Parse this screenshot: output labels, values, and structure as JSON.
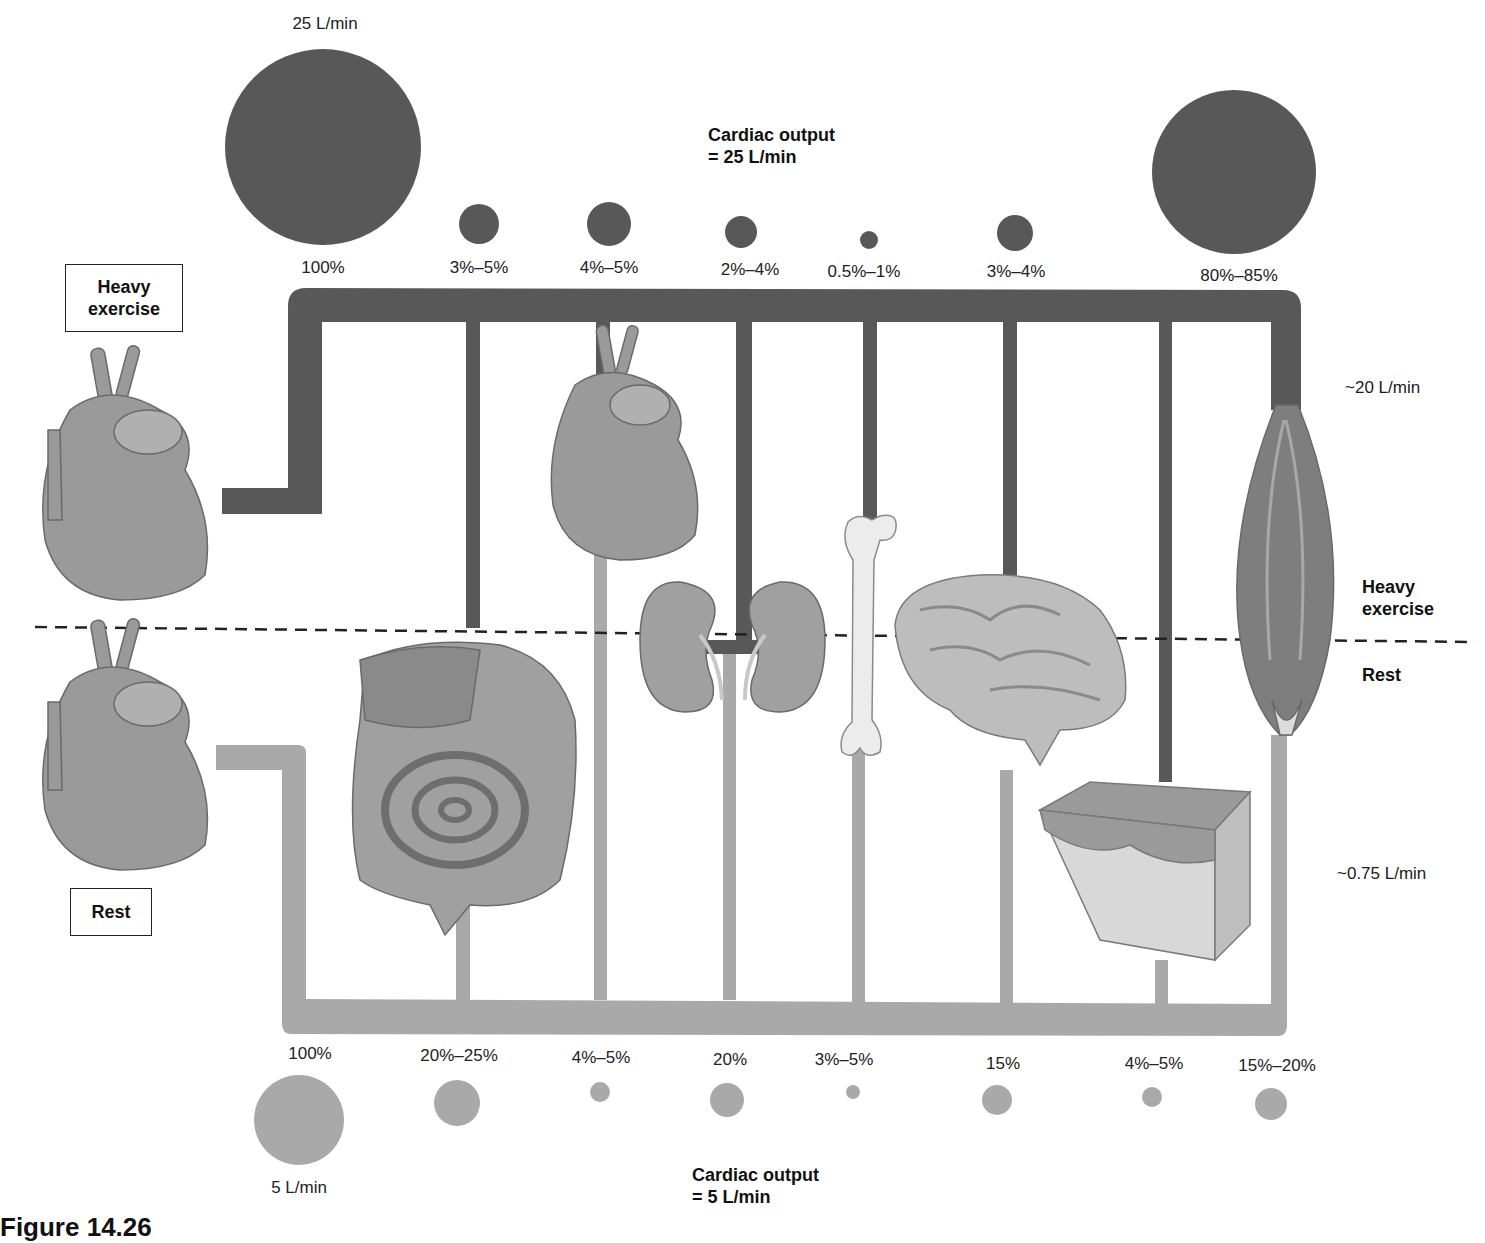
{
  "colors": {
    "exercise_flow": "#585858",
    "rest_flow": "#a9a9a9",
    "organ_fill": "#9a9a9a",
    "text": "#1a1a1a"
  },
  "labels": {
    "heavy_exercise_box": "Heavy exercise",
    "rest_box": "Rest",
    "divider_heavy": "Heavy exercise",
    "divider_rest": "Rest",
    "top_total_flow": "25 L/min",
    "bottom_total_flow": "5 L/min",
    "cardiac_output_exercise_line1": "Cardiac output",
    "cardiac_output_exercise_line2": "= 25 L/min",
    "cardiac_output_rest_line1": "Cardiac output",
    "cardiac_output_rest_line2": "= 5 L/min",
    "muscle_exercise_flow": "~20 L/min",
    "muscle_rest_flow": "~0.75 L/min",
    "caption": "Figure 14.26"
  },
  "chart_data": {
    "type": "bubble-flow-diagram",
    "categories": [
      "Total",
      "Digestive tract & liver",
      "Heart",
      "Kidneys",
      "Bone",
      "Brain",
      "Skin",
      "Skeletal muscle"
    ],
    "series": [
      {
        "name": "Heavy exercise",
        "cardiac_output": "25 L/min",
        "values": [
          "100%",
          "3%–5%",
          "4%–5%",
          "2%–4%",
          "0.5%–1%",
          "3%–4%",
          null,
          "80%–85%"
        ]
      },
      {
        "name": "Rest",
        "cardiac_output": "5 L/min",
        "values": [
          "100%",
          "20%–25%",
          "4%–5%",
          "20%",
          "3%–5%",
          "15%",
          "4%–5%",
          "15%–20%"
        ]
      }
    ],
    "annotations": [
      "25 L/min",
      "5 L/min",
      "~20 L/min",
      "~0.75 L/min"
    ]
  },
  "top_row": [
    {
      "label": "100%",
      "x": 323,
      "y": 268,
      "cx": 323,
      "cy": 147,
      "d": 196
    },
    {
      "label": "3%–5%",
      "x": 479,
      "y": 268,
      "cx": 479,
      "cy": 224,
      "d": 40
    },
    {
      "label": "4%–5%",
      "x": 609,
      "y": 268,
      "cx": 609,
      "cy": 224,
      "d": 44
    },
    {
      "label": "2%–4%",
      "x": 750,
      "y": 270,
      "cx": 741,
      "cy": 232,
      "d": 32
    },
    {
      "label": "0.5%–1%",
      "x": 864,
      "y": 272,
      "cx": 869,
      "cy": 240,
      "d": 18
    },
    {
      "label": "3%–4%",
      "x": 1016,
      "y": 272,
      "cx": 1015,
      "cy": 233,
      "d": 36
    },
    {
      "label": "80%–85%",
      "x": 1239,
      "y": 276,
      "cx": 1234,
      "cy": 172,
      "d": 164
    }
  ],
  "bottom_row": [
    {
      "label": "100%",
      "x": 310,
      "y": 1054,
      "cx": 299,
      "cy": 1120,
      "d": 90
    },
    {
      "label": "20%–25%",
      "x": 459,
      "y": 1056,
      "cx": 457,
      "cy": 1103,
      "d": 46
    },
    {
      "label": "4%–5%",
      "x": 601,
      "y": 1058,
      "cx": 600,
      "cy": 1092,
      "d": 20
    },
    {
      "label": "20%",
      "x": 730,
      "y": 1060,
      "cx": 727,
      "cy": 1100,
      "d": 34
    },
    {
      "label": "3%–5%",
      "x": 844,
      "y": 1060,
      "cx": 853,
      "cy": 1092,
      "d": 14
    },
    {
      "label": "15%",
      "x": 1003,
      "y": 1064,
      "cx": 997,
      "cy": 1100,
      "d": 30
    },
    {
      "label": "4%–5%",
      "x": 1154,
      "y": 1064,
      "cx": 1152,
      "cy": 1097,
      "d": 20
    },
    {
      "label": "15%–20%",
      "x": 1277,
      "y": 1066,
      "cx": 1271,
      "cy": 1104,
      "d": 32
    }
  ],
  "organs": [
    "heart-exercise",
    "heart-rest",
    "heart-organ",
    "digestive-tract",
    "kidneys",
    "bone",
    "brain",
    "skin",
    "skeletal-muscle"
  ]
}
